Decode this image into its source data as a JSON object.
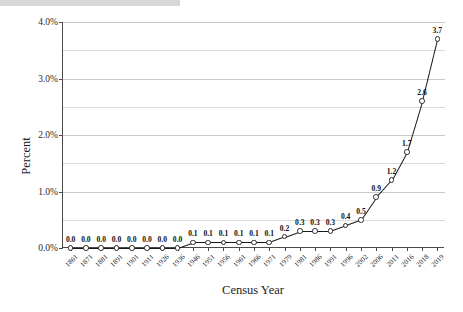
{
  "chart_data": {
    "type": "line",
    "title": "",
    "xlabel": "Census Year",
    "ylabel": "Percent",
    "ylim": [
      0,
      4.0
    ],
    "ytick_labels": [
      "0.0%",
      "1.0%",
      "2.0%",
      "3.0%",
      "4.0%"
    ],
    "ytick_values": [
      0,
      1.0,
      2.0,
      3.0,
      4.0
    ],
    "minor_gridlines": [
      0.5,
      1.5,
      2.5,
      3.5
    ],
    "grid": true,
    "legend": "none",
    "marker": "open-circle",
    "line_color": "#1a1a1a",
    "marker_face_color": "#ffffff",
    "categories": [
      "1861",
      "1871",
      "1881",
      "1891",
      "1901",
      "1911",
      "1926",
      "1936",
      "1946",
      "1951",
      "1956",
      "1961",
      "1966",
      "1971",
      "1979",
      "1981",
      "1986",
      "1991",
      "1996",
      "2002",
      "2006",
      "2011",
      "2016",
      "2018",
      "2019"
    ],
    "values": [
      0.0,
      0.0,
      0.0,
      0.0,
      0.0,
      0.0,
      0.0,
      0.0,
      0.1,
      0.1,
      0.1,
      0.1,
      0.1,
      0.1,
      0.2,
      0.3,
      0.3,
      0.3,
      0.4,
      0.5,
      0.9,
      1.2,
      1.7,
      2.6,
      3.7
    ],
    "data_labels": [
      "0.0",
      "0.0",
      "0.0",
      "0.0",
      "0.0",
      "0.0",
      "0.0",
      "0.0",
      "0.1",
      "0.1",
      "0.1",
      "0.1",
      "0.1",
      "0.1",
      "0.2",
      "0.3",
      "0.3",
      "0.3",
      "0.4",
      "0.5",
      "0.9",
      "1.2",
      "1.7",
      "2.6",
      "3.7"
    ]
  }
}
